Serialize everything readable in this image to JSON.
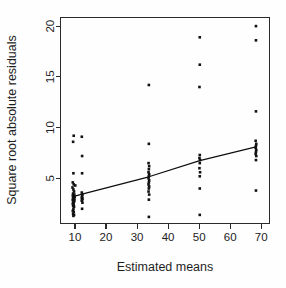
{
  "chart_data": {
    "type": "scatter",
    "title": "",
    "xlabel": "Estimated means",
    "ylabel": "Square root absolute residuals",
    "xlim": [
      5.5,
      72.5
    ],
    "ylim": [
      0.6,
      20.8
    ],
    "xticks": [
      10,
      20,
      30,
      40,
      50,
      60,
      70
    ],
    "xticklabels": [
      "10",
      "20",
      "30",
      "40",
      "50",
      "60",
      "70"
    ],
    "yticks": [
      5,
      10,
      15,
      20
    ],
    "yticklabels": [
      "5",
      "10",
      "15",
      "20"
    ],
    "grid": false,
    "legend": null,
    "box": true,
    "point_color": "#111111",
    "line_color": "#0d0d0d",
    "groups": [
      {
        "x": 9.6,
        "label": "group-1"
      },
      {
        "x": 12.3,
        "label": "group-2"
      },
      {
        "x": 33.8,
        "label": "group-3"
      },
      {
        "x": 50.2,
        "label": "group-4"
      },
      {
        "x": 68.3,
        "label": "group-5"
      }
    ],
    "points": [
      {
        "x": 9.4,
        "y": 8.6
      },
      {
        "x": 9.6,
        "y": 9.2
      },
      {
        "x": 12.2,
        "y": 9.1
      },
      {
        "x": 12.3,
        "y": 7.2
      },
      {
        "x": 9.5,
        "y": 5.5
      },
      {
        "x": 12.3,
        "y": 5.5
      },
      {
        "x": 9.3,
        "y": 4.6
      },
      {
        "x": 9.6,
        "y": 4.4
      },
      {
        "x": 10.1,
        "y": 4.3
      },
      {
        "x": 9.2,
        "y": 4.1
      },
      {
        "x": 9.5,
        "y": 3.9
      },
      {
        "x": 9.7,
        "y": 3.7
      },
      {
        "x": 9.4,
        "y": 3.5
      },
      {
        "x": 9.8,
        "y": 3.4
      },
      {
        "x": 9.3,
        "y": 3.3
      },
      {
        "x": 9.6,
        "y": 3.2
      },
      {
        "x": 9.9,
        "y": 3.15
      },
      {
        "x": 9.4,
        "y": 3.05
      },
      {
        "x": 9.7,
        "y": 3.0
      },
      {
        "x": 9.5,
        "y": 2.95
      },
      {
        "x": 9.3,
        "y": 2.9
      },
      {
        "x": 9.8,
        "y": 2.85
      },
      {
        "x": 9.6,
        "y": 2.8
      },
      {
        "x": 9.4,
        "y": 2.75
      },
      {
        "x": 9.7,
        "y": 2.7
      },
      {
        "x": 9.5,
        "y": 2.6
      },
      {
        "x": 9.3,
        "y": 2.5
      },
      {
        "x": 9.6,
        "y": 2.4
      },
      {
        "x": 9.4,
        "y": 2.3
      },
      {
        "x": 9.7,
        "y": 2.2
      },
      {
        "x": 9.5,
        "y": 2.0
      },
      {
        "x": 9.3,
        "y": 1.8
      },
      {
        "x": 9.6,
        "y": 1.7
      },
      {
        "x": 9.4,
        "y": 1.5
      },
      {
        "x": 9.7,
        "y": 1.4
      },
      {
        "x": 9.5,
        "y": 1.3
      },
      {
        "x": 12.2,
        "y": 3.6
      },
      {
        "x": 12.4,
        "y": 3.4
      },
      {
        "x": 12.3,
        "y": 3.2
      },
      {
        "x": 12.2,
        "y": 3.1
      },
      {
        "x": 12.4,
        "y": 3.0
      },
      {
        "x": 12.3,
        "y": 2.9
      },
      {
        "x": 12.2,
        "y": 2.8
      },
      {
        "x": 12.4,
        "y": 2.6
      },
      {
        "x": 12.3,
        "y": 2.0
      },
      {
        "x": 33.8,
        "y": 14.2
      },
      {
        "x": 33.8,
        "y": 8.4
      },
      {
        "x": 33.7,
        "y": 6.5
      },
      {
        "x": 33.9,
        "y": 6.2
      },
      {
        "x": 33.8,
        "y": 5.9
      },
      {
        "x": 33.7,
        "y": 5.6
      },
      {
        "x": 33.9,
        "y": 5.4
      },
      {
        "x": 33.8,
        "y": 5.2
      },
      {
        "x": 33.7,
        "y": 5.0
      },
      {
        "x": 33.9,
        "y": 4.8
      },
      {
        "x": 33.8,
        "y": 4.6
      },
      {
        "x": 33.7,
        "y": 4.4
      },
      {
        "x": 33.9,
        "y": 4.2
      },
      {
        "x": 33.8,
        "y": 4.0
      },
      {
        "x": 33.7,
        "y": 3.7
      },
      {
        "x": 33.9,
        "y": 3.4
      },
      {
        "x": 33.8,
        "y": 2.9
      },
      {
        "x": 33.8,
        "y": 1.2
      },
      {
        "x": 50.2,
        "y": 18.9
      },
      {
        "x": 50.2,
        "y": 16.2
      },
      {
        "x": 50.1,
        "y": 14.0
      },
      {
        "x": 50.2,
        "y": 7.3
      },
      {
        "x": 50.1,
        "y": 7.0
      },
      {
        "x": 50.3,
        "y": 6.8
      },
      {
        "x": 50.2,
        "y": 6.5
      },
      {
        "x": 50.1,
        "y": 6.0
      },
      {
        "x": 50.3,
        "y": 5.6
      },
      {
        "x": 50.2,
        "y": 5.2
      },
      {
        "x": 50.2,
        "y": 4.0
      },
      {
        "x": 50.2,
        "y": 1.4
      },
      {
        "x": 68.3,
        "y": 20.0
      },
      {
        "x": 68.3,
        "y": 18.6
      },
      {
        "x": 68.3,
        "y": 11.6
      },
      {
        "x": 68.2,
        "y": 8.7
      },
      {
        "x": 68.4,
        "y": 8.4
      },
      {
        "x": 68.3,
        "y": 8.2
      },
      {
        "x": 68.2,
        "y": 8.0
      },
      {
        "x": 68.4,
        "y": 7.8
      },
      {
        "x": 68.3,
        "y": 7.6
      },
      {
        "x": 68.2,
        "y": 7.4
      },
      {
        "x": 68.4,
        "y": 7.2
      },
      {
        "x": 68.3,
        "y": 6.8
      },
      {
        "x": 68.3,
        "y": 3.8
      }
    ],
    "trend": [
      {
        "x": 9.4,
        "y": 3.2
      },
      {
        "x": 12.3,
        "y": 3.45
      },
      {
        "x": 33.8,
        "y": 5.15
      },
      {
        "x": 50.2,
        "y": 6.75
      },
      {
        "x": 68.3,
        "y": 8.1
      }
    ]
  }
}
